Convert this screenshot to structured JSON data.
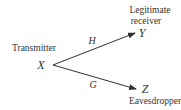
{
  "diagram": {
    "nodes": [
      {
        "id": "X",
        "label": "X",
        "role": "Transmitter"
      },
      {
        "id": "Y",
        "label": "Y",
        "role_lines": [
          "Legitimate",
          "receiver"
        ]
      },
      {
        "id": "Z",
        "label": "Z",
        "role": "Eavesdropper"
      }
    ],
    "edges": [
      {
        "from": "X",
        "to": "Y",
        "label": "H"
      },
      {
        "from": "X",
        "to": "Z",
        "label": "G"
      }
    ],
    "colors": {
      "line": "#333333",
      "text": "#333333"
    }
  }
}
